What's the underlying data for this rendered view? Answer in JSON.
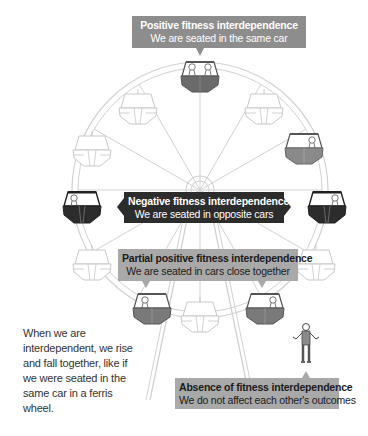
{
  "colors": {
    "positive_car": "#6b6b6b",
    "negative_car": "#2c2c2c",
    "partial_car": "#7a7a7a",
    "empty_car_stroke": "#c8c8c8",
    "wheel_stroke": "#cfcfcf",
    "positive_box": "#8d8d8d",
    "negative_box": "#2c2c2c",
    "partial_box": "#a9a9a9",
    "absence_box": "#a9a9a9"
  },
  "labels": {
    "positive": {
      "title": "Positive fitness interdependence",
      "subtitle": "We are seated in the same car"
    },
    "negative": {
      "title": "Negative fitness interdependence",
      "subtitle": "We are seated in opposite cars"
    },
    "partial": {
      "title": "Partial positive fitness interdependence",
      "subtitle": "We are seated in cars close together"
    },
    "absence": {
      "title": "Absence of fitness interdependence",
      "subtitle": "We do not affect each other's outcomes"
    }
  },
  "caption": "When we are interdependent, we rise and fall together, like if we were seated in the same car in a ferris wheel.",
  "figures": {
    "wheel": "ferris-wheel",
    "cars": [
      {
        "position": "top",
        "fill": "positive",
        "passengers": 2
      },
      {
        "position": "upper-right",
        "fill": "empty",
        "passengers": 0
      },
      {
        "position": "right-upper",
        "fill": "partial-gray",
        "passengers": 1
      },
      {
        "position": "right",
        "fill": "negative",
        "passengers": 1
      },
      {
        "position": "right-lower",
        "fill": "empty",
        "passengers": 0
      },
      {
        "position": "bottom-right",
        "fill": "partial",
        "passengers": 1
      },
      {
        "position": "bottom",
        "fill": "empty",
        "passengers": 0
      },
      {
        "position": "bottom-left",
        "fill": "partial",
        "passengers": 1
      },
      {
        "position": "left-lower",
        "fill": "empty",
        "passengers": 0
      },
      {
        "position": "left",
        "fill": "negative",
        "passengers": 1
      },
      {
        "position": "left-upper",
        "fill": "empty",
        "passengers": 0
      },
      {
        "position": "upper-left",
        "fill": "empty",
        "passengers": 0
      }
    ],
    "standing_person": "person-shrugging"
  }
}
